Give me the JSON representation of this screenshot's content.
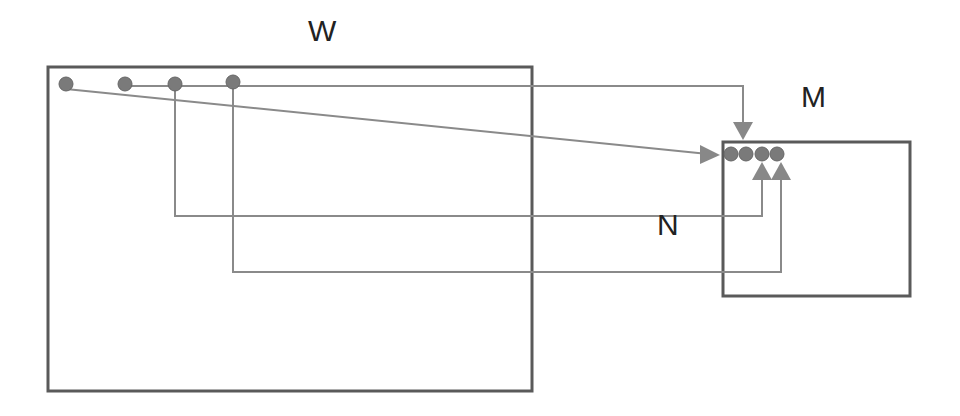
{
  "labels": {
    "w": "W",
    "m": "M",
    "n": "N"
  },
  "colors": {
    "line": "#8a8a8a",
    "box": "#5a5a5a",
    "node": "#7a7a7a",
    "arrow": "#888888",
    "text": "#222222"
  },
  "diagram": {
    "boxes": [
      {
        "id": "W",
        "x": 47,
        "y": 67,
        "w": 485,
        "h": 324
      },
      {
        "id": "M",
        "x": 722,
        "y": 142,
        "w": 188,
        "h": 154
      }
    ],
    "source_nodes": [
      {
        "x": 66,
        "y": 84
      },
      {
        "x": 125,
        "y": 84
      },
      {
        "x": 175,
        "y": 84
      },
      {
        "x": 233,
        "y": 82
      }
    ],
    "target_nodes": [
      {
        "x": 731,
        "y": 154
      },
      {
        "x": 746,
        "y": 154
      },
      {
        "x": 762,
        "y": 154
      },
      {
        "x": 777,
        "y": 154
      }
    ]
  }
}
